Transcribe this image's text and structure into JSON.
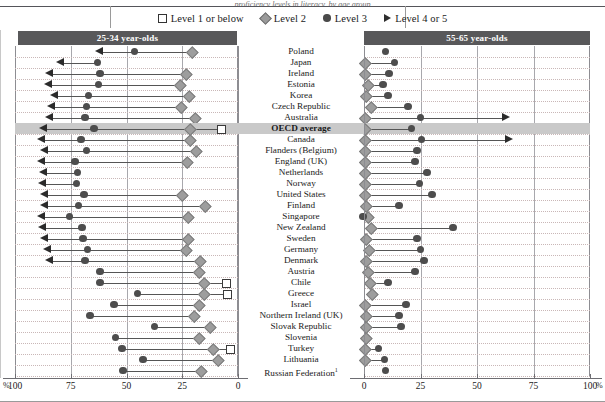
{
  "figure": {
    "clipped_caption": "proficiency levels in literacy, by age group",
    "legend": [
      {
        "marker": "square-outline",
        "label": "Level 1 or below"
      },
      {
        "marker": "diamond",
        "label": "Level 2"
      },
      {
        "marker": "circle",
        "label": "Level 3"
      },
      {
        "marker": "triangle",
        "label": "Level 4 or 5"
      }
    ],
    "panels": {
      "left": {
        "title": "25-34 year-olds",
        "axis_ticks": [
          100,
          75,
          50,
          25,
          0
        ],
        "axis_unit": "%",
        "direction": "reversed"
      },
      "right": {
        "title": "55-65 year-olds",
        "axis_ticks": [
          0,
          25,
          50,
          75,
          100
        ],
        "axis_unit": "%",
        "direction": "normal"
      }
    }
  },
  "chart_data": {
    "type": "scatter",
    "xlabel": "%",
    "ylabel": "",
    "series_names": [
      "Level 1 or below",
      "Level 2",
      "Level 3",
      "Level 4 or 5"
    ],
    "left_xlim": [
      100,
      0
    ],
    "right_xlim": [
      0,
      100
    ],
    "grid": true,
    "legend_position": "top-center",
    "categories": [
      "Poland",
      "Japan",
      "Ireland",
      "Estonia",
      "Korea",
      "Czech Republic",
      "Australia",
      "OECD average",
      "Canada",
      "Flanders (Belgium)",
      "England (UK)",
      "Netherlands",
      "Norway",
      "United States",
      "Finland",
      "Singapore",
      "New Zealand",
      "Sweden",
      "Germany",
      "Denmark",
      "Austria",
      "Chile",
      "Greece",
      "Israel",
      "Northern Ireland (UK)",
      "Slovak Republic",
      "Slovenia",
      "Turkey",
      "Lithuania",
      "Russian Federation"
    ],
    "rows": [
      {
        "country": "Poland",
        "highlight": false,
        "left": {
          "l4": 60.5,
          "l3": 46.5,
          "l2": 20.5,
          "l1": null
        },
        "right": {
          "l2": null,
          "l3": 9.5,
          "l4": null,
          "l1": null
        }
      },
      {
        "country": "Japan",
        "highlight": false,
        "left": {
          "l4": 78.0,
          "l3": 63.0,
          "l2": null,
          "l1": null
        },
        "right": {
          "l2": 0.5,
          "l3": 13.5,
          "l4": null,
          "l1": null
        }
      },
      {
        "country": "Ireland",
        "highlight": false,
        "left": {
          "l4": 83.0,
          "l3": 62.0,
          "l2": 23.5,
          "l1": null
        },
        "right": {
          "l2": 0.5,
          "l3": 11.0,
          "l4": null,
          "l1": null
        }
      },
      {
        "country": "Estonia",
        "highlight": false,
        "left": {
          "l4": 83.5,
          "l3": 62.5,
          "l2": 26.0,
          "l1": null
        },
        "right": {
          "l2": 1.5,
          "l3": 8.5,
          "l4": null,
          "l1": null
        }
      },
      {
        "country": "Korea",
        "highlight": false,
        "left": {
          "l4": 80.5,
          "l3": 67.0,
          "l2": 22.0,
          "l1": null
        },
        "right": {
          "l2": 1.0,
          "l3": 10.5,
          "l4": null,
          "l1": null
        }
      },
      {
        "country": "Czech Republic",
        "highlight": false,
        "left": {
          "l4": 82.0,
          "l3": 68.0,
          "l2": 25.5,
          "l1": null
        },
        "right": {
          "l2": 3.0,
          "l3": 19.5,
          "l4": null,
          "l1": null
        }
      },
      {
        "country": "Australia",
        "highlight": false,
        "left": {
          "l4": 83.0,
          "l3": 68.5,
          "l2": 19.5,
          "l1": null
        },
        "right": {
          "l2": 0.5,
          "l3": 25.0,
          "l4": 61.0,
          "l1": null
        }
      },
      {
        "country": "OECD average",
        "highlight": true,
        "left": {
          "l4": 85.5,
          "l3": 64.5,
          "l2": 21.5,
          "l1": 8.0
        },
        "right": {
          "l2": 0.5,
          "l3": 21.0,
          "l4": null,
          "l1": null
        }
      },
      {
        "country": "Canada",
        "highlight": false,
        "left": {
          "l4": 86.5,
          "l3": 70.5,
          "l2": 21.5,
          "l1": null
        },
        "right": {
          "l2": 0.5,
          "l3": 25.5,
          "l4": 62.5,
          "l1": null
        }
      },
      {
        "country": "Flanders (Belgium)",
        "highlight": false,
        "left": {
          "l4": 85.0,
          "l3": 68.0,
          "l2": 19.0,
          "l1": null
        },
        "right": {
          "l2": 0.5,
          "l3": 23.5,
          "l4": null,
          "l1": null
        }
      },
      {
        "country": "England (UK)",
        "highlight": false,
        "left": {
          "l4": 86.5,
          "l3": 73.0,
          "l2": 23.0,
          "l1": null
        },
        "right": {
          "l2": 0.5,
          "l3": 22.5,
          "l4": null,
          "l1": null
        }
      },
      {
        "country": "Netherlands",
        "highlight": false,
        "left": {
          "l4": 85.5,
          "l3": 72.0,
          "l2": null,
          "l1": null
        },
        "right": {
          "l2": 0.5,
          "l3": 28.0,
          "l4": null,
          "l1": null
        }
      },
      {
        "country": "Norway",
        "highlight": false,
        "left": {
          "l4": 86.0,
          "l3": 72.5,
          "l2": null,
          "l1": null
        },
        "right": {
          "l2": 0.5,
          "l3": 24.5,
          "l4": null,
          "l1": null
        }
      },
      {
        "country": "United States",
        "highlight": false,
        "left": {
          "l4": 85.0,
          "l3": 69.0,
          "l2": 25.0,
          "l1": null
        },
        "right": {
          "l2": 0.5,
          "l3": 30.0,
          "l4": null,
          "l1": null
        }
      },
      {
        "country": "Finland",
        "highlight": false,
        "left": {
          "l4": 85.0,
          "l3": 71.5,
          "l2": 15.0,
          "l1": null
        },
        "right": {
          "l2": 1.0,
          "l3": 15.5,
          "l4": null,
          "l1": null
        }
      },
      {
        "country": "Singapore",
        "highlight": false,
        "left": {
          "l4": 86.5,
          "l3": 75.5,
          "l2": 22.5,
          "l1": null
        },
        "right": {
          "l2": 1.5,
          "l3": -0.5,
          "l4": null,
          "l1": null
        }
      },
      {
        "country": "New Zealand",
        "highlight": false,
        "left": {
          "l4": 86.0,
          "l3": 70.0,
          "l2": null,
          "l1": null
        },
        "right": {
          "l2": 3.0,
          "l3": 39.5,
          "l4": null,
          "l1": null
        }
      },
      {
        "country": "Sweden",
        "highlight": false,
        "left": {
          "l4": 85.0,
          "l3": 69.5,
          "l2": 22.5,
          "l1": null
        },
        "right": {
          "l2": 1.0,
          "l3": 23.5,
          "l4": null,
          "l1": null
        }
      },
      {
        "country": "Germany",
        "highlight": false,
        "left": {
          "l4": 84.0,
          "l3": 67.5,
          "l2": 23.5,
          "l1": null
        },
        "right": {
          "l2": 2.0,
          "l3": 25.0,
          "l4": null,
          "l1": null
        }
      },
      {
        "country": "Denmark",
        "highlight": false,
        "left": {
          "l4": 83.0,
          "l3": 68.5,
          "l2": 17.0,
          "l1": null
        },
        "right": {
          "l2": 1.0,
          "l3": 26.5,
          "l4": null,
          "l1": null
        }
      },
      {
        "country": "Austria",
        "highlight": false,
        "left": {
          "l4": null,
          "l3": 62.0,
          "l2": 17.5,
          "l1": null
        },
        "right": {
          "l2": 1.5,
          "l3": 22.5,
          "l4": null,
          "l1": null
        }
      },
      {
        "country": "Chile",
        "highlight": false,
        "left": {
          "l4": null,
          "l3": 62.0,
          "l2": 15.5,
          "l1": 5.5
        },
        "right": {
          "l2": 2.5,
          "l3": 10.5,
          "l4": null,
          "l1": null
        }
      },
      {
        "country": "Greece",
        "highlight": false,
        "left": {
          "l4": null,
          "l3": 45.0,
          "l2": 15.5,
          "l1": 5.0
        },
        "right": {
          "l2": 3.5,
          "l3": null,
          "l4": null,
          "l1": null
        }
      },
      {
        "country": "Israel",
        "highlight": false,
        "left": {
          "l4": null,
          "l3": 55.5,
          "l2": 17.5,
          "l1": null
        },
        "right": {
          "l2": 0.5,
          "l3": 18.5,
          "l4": null,
          "l1": null
        }
      },
      {
        "country": "Northern Ireland (UK)",
        "highlight": false,
        "left": {
          "l4": null,
          "l3": 66.5,
          "l2": 20.0,
          "l1": null
        },
        "right": {
          "l2": 1.0,
          "l3": 15.5,
          "l4": null,
          "l1": null
        }
      },
      {
        "country": "Slovak Republic",
        "highlight": false,
        "left": {
          "l4": null,
          "l3": 37.5,
          "l2": 12.5,
          "l1": null
        },
        "right": {
          "l2": 1.0,
          "l3": 16.5,
          "l4": null,
          "l1": null
        }
      },
      {
        "country": "Slovenia",
        "highlight": false,
        "left": {
          "l4": null,
          "l3": 55.0,
          "l2": 17.5,
          "l1": null
        },
        "right": {
          "l2": 1.0,
          "l3": null,
          "l4": null,
          "l1": null
        }
      },
      {
        "country": "Turkey",
        "highlight": false,
        "left": {
          "l4": null,
          "l3": 52.0,
          "l2": 11.5,
          "l1": 4.0
        },
        "right": {
          "l2": 0.5,
          "l3": 6.5,
          "l4": null,
          "l1": null
        }
      },
      {
        "country": "Lithuania",
        "highlight": false,
        "left": {
          "l4": null,
          "l3": 42.5,
          "l2": 9.0,
          "l1": null
        },
        "right": {
          "l2": 0.5,
          "l3": 9.0,
          "l4": null,
          "l1": null
        }
      },
      {
        "country": "Russian Federation",
        "highlight": false,
        "note": "1",
        "left": {
          "l4": null,
          "l3": 51.5,
          "l2": 16.5,
          "l1": null
        },
        "right": {
          "l2": null,
          "l3": 9.5,
          "l4": null,
          "l1": null
        }
      }
    ]
  },
  "axis": {
    "left_labels": [
      "100",
      "75",
      "50",
      "25",
      "0"
    ],
    "right_labels": [
      "0",
      "25",
      "50",
      "75",
      "100"
    ],
    "unit_left": "%",
    "unit_right": "%"
  }
}
